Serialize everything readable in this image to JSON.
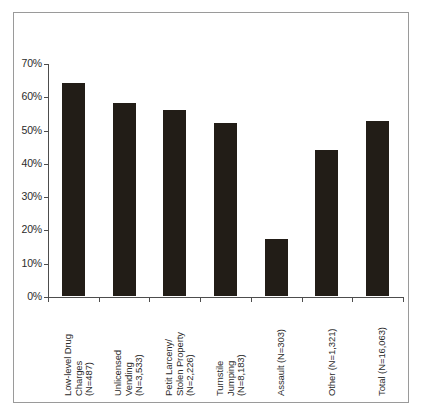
{
  "chart_data": {
    "type": "bar",
    "title": "",
    "subtitle": "",
    "xlabel": "",
    "ylabel": "",
    "ylim": [
      0,
      70
    ],
    "grid": false,
    "legend": "none",
    "orientation": "vertical",
    "bar_color": "#221d17",
    "axis_color": "#4d4d4d",
    "frame_color": "#9a9a9a",
    "y_ticks": [
      {
        "value": 0,
        "label": "0%"
      },
      {
        "value": 10,
        "label": "10%"
      },
      {
        "value": 20,
        "label": "20%"
      },
      {
        "value": 30,
        "label": "30%"
      },
      {
        "value": 40,
        "label": "40%"
      },
      {
        "value": 50,
        "label": "50%"
      },
      {
        "value": 60,
        "label": "60%"
      },
      {
        "value": 70,
        "label": "70%"
      }
    ],
    "categories": [
      "Low-level Drug Charges (N=487)",
      "Unlicensed Vending (N=3,533)",
      "Petit Larceny/ Stolen Property (N=2,226)",
      "Turnstile Jumping (N=8,183)",
      "Assault (N=303)",
      "Other (N=1,321)",
      "Total (N=16,063)"
    ],
    "category_lines": [
      [
        "Low-level Drug",
        "Charges",
        "(N=487)"
      ],
      [
        "Unlicensed",
        "Vending",
        "(N=3,533)"
      ],
      [
        "Petit Larceny/",
        "Stolen Property",
        "(N=2,226)"
      ],
      [
        "Turnstile",
        "Jumping",
        "(N=8,183)"
      ],
      [
        "Assault (N=303)"
      ],
      [
        "Other (N=1,321)"
      ],
      [
        "Total (N=16,063)"
      ]
    ],
    "values": [
      64,
      58,
      56,
      52,
      17,
      44,
      52.5
    ]
  }
}
